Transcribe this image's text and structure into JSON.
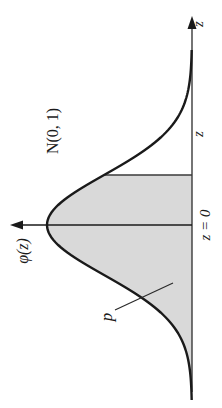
{
  "figure": {
    "title": "",
    "distribution_label": "N(0, 1)",
    "density_label": "φ(z)",
    "axis_label": "z",
    "cutoff_label": "z",
    "mean_label": "z = 0",
    "area_label": "p",
    "orientation": "rotated 90° counterclockwise",
    "colors": {
      "curve": "#1a1a1a",
      "axis": "#3a3a3a",
      "shade": "#d9d9d9",
      "background": "#ffffff"
    }
  },
  "chart_data": {
    "type": "area",
    "title": "N(0, 1)",
    "xlabel": "z",
    "ylabel": "φ(z)",
    "distribution": "standard normal",
    "mean": 0,
    "sd": 1,
    "x_range": [
      -3.5,
      3.5
    ],
    "shaded_region": {
      "from": "-inf",
      "to": "z",
      "z_approx": 1.0,
      "label": "p"
    },
    "tick_labels": [
      "z = 0",
      "z"
    ],
    "grid": false,
    "legend": "none"
  }
}
